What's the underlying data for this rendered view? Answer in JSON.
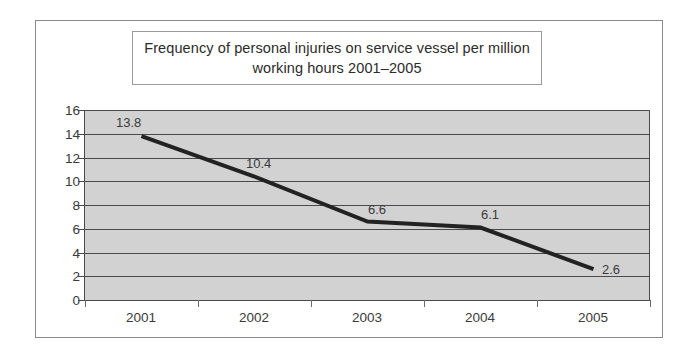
{
  "chart_data": {
    "type": "line",
    "title": "Frequency of personal injuries on service vessel per million working hours 2001–2005",
    "categories": [
      "2001",
      "2002",
      "2003",
      "2004",
      "2005"
    ],
    "values": [
      13.8,
      10.4,
      6.6,
      6.1,
      2.6
    ],
    "point_labels": [
      "13.8",
      "10.4",
      "6.6",
      "6.1",
      "2.6"
    ],
    "xlabel": "",
    "ylabel": "",
    "ylim": [
      0,
      16
    ],
    "yticks": [
      "0",
      "2",
      "4",
      "6",
      "8",
      "10",
      "12",
      "14",
      "16"
    ],
    "grid": true,
    "legend": false,
    "series_name": "Frequency of personal injuries per million working hours",
    "colors": {
      "line": "#222222",
      "plot_background": "#d2d2d2",
      "gridline": "#4a4a4a",
      "axis": "#4a4a4a",
      "text": "#3a3a3a",
      "frame_border": "#8a8a8a",
      "title_border": "#9a9a9a",
      "page_background": "#ffffff"
    }
  }
}
